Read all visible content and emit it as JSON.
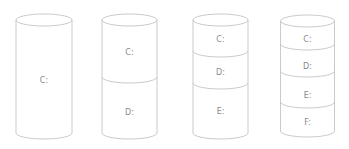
{
  "diagram": {
    "colors": {
      "stroke": "#c4c4c4",
      "label": "#8a8a8a",
      "background": "#ffffff"
    },
    "cylinders": [
      {
        "id": "one-partition",
        "partitions": [
          "C:"
        ]
      },
      {
        "id": "two-partitions",
        "partitions": [
          "C:",
          "D:"
        ]
      },
      {
        "id": "three-partitions",
        "partitions": [
          "C:",
          "D:",
          "E:"
        ]
      },
      {
        "id": "four-partitions",
        "partitions": [
          "C:",
          "D:",
          "E:",
          "F:"
        ]
      }
    ]
  }
}
